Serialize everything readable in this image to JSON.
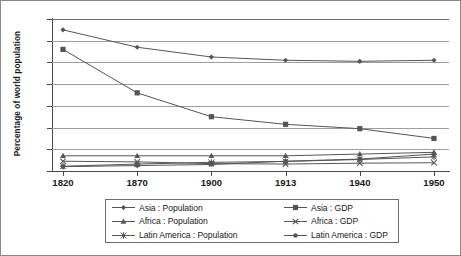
{
  "chart_data": {
    "type": "line",
    "title": "",
    "xlabel": "",
    "ylabel": "Percentage of world population",
    "categories": [
      "1820",
      "1870",
      "1900",
      "1913",
      "1940",
      "1950"
    ],
    "ylim": [
      0,
      70
    ],
    "y_ticks": [
      0,
      10,
      20,
      30,
      40,
      50,
      60,
      70
    ],
    "grid": true,
    "legend_position": "bottom",
    "series": [
      {
        "name": "Asia : Population",
        "marker": "diamond",
        "values": [
          65.0,
          57.0,
          52.5,
          51.0,
          50.5,
          51.0
        ]
      },
      {
        "name": "Asia : GDP",
        "marker": "square",
        "values": [
          56.0,
          36.0,
          25.0,
          21.5,
          19.5,
          15.0
        ]
      },
      {
        "name": "Africa : Population",
        "marker": "triangle",
        "values": [
          7.0,
          7.0,
          7.0,
          7.0,
          7.8,
          8.6
        ]
      },
      {
        "name": "Africa : GDP",
        "marker": "cross",
        "values": [
          4.5,
          4.2,
          3.4,
          3.2,
          3.6,
          3.8
        ]
      },
      {
        "name": "Latin America : Population",
        "marker": "star",
        "values": [
          2.2,
          3.2,
          4.0,
          4.4,
          5.3,
          6.5
        ]
      },
      {
        "name": "Latin America : GDP",
        "marker": "circle",
        "values": [
          2.0,
          2.5,
          3.0,
          4.5,
          5.5,
          7.8
        ]
      }
    ]
  },
  "axes": {
    "y_title": "Percentage of world population",
    "y_tick_labels": [
      "70",
      "60",
      "50",
      "40",
      "30",
      "20",
      "10",
      "0"
    ],
    "x_tick_labels": [
      "1820",
      "1870",
      "1900",
      "1913",
      "1940",
      "1950"
    ]
  },
  "legend": {
    "entries": [
      {
        "label": "Asia : Population",
        "marker": "diamond"
      },
      {
        "label": "Asia : GDP",
        "marker": "square"
      },
      {
        "label": "Africa : Population",
        "marker": "triangle"
      },
      {
        "label": "Africa : GDP",
        "marker": "cross"
      },
      {
        "label": "Latin America : Population",
        "marker": "star"
      },
      {
        "label": "Latin America : GDP",
        "marker": "circle"
      }
    ]
  },
  "colors": {
    "line": "#555555",
    "grid": "#9d9d9d",
    "axis": "#4a4a4a",
    "text": "#1a1a1a",
    "border": "#8a8a8a"
  }
}
